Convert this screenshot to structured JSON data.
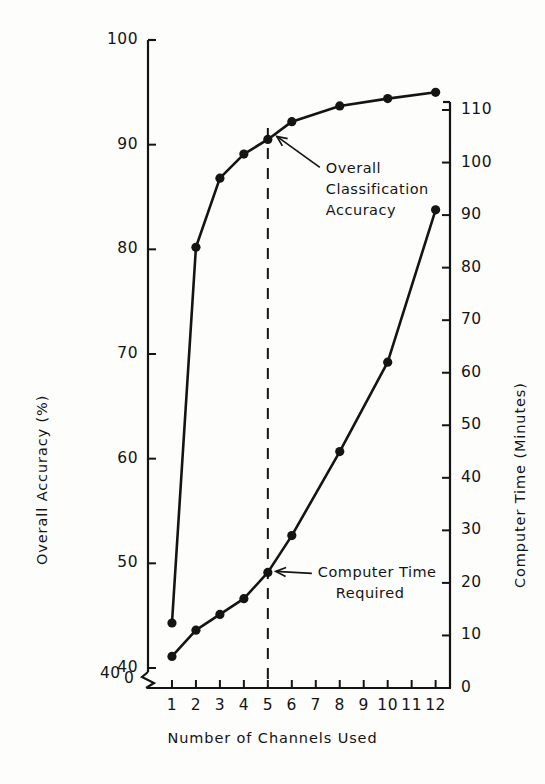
{
  "chart_data": {
    "type": "line",
    "title": "",
    "xlabel": "Number of Channels Used",
    "ylabel": "Overall Accuracy (%)",
    "y2label": "Computer Time (Minutes)",
    "grid": false,
    "legend": "none",
    "xlim": [
      0,
      12.6
    ],
    "ylim": [
      40,
      100
    ],
    "y2lim": [
      0,
      110
    ],
    "x_ticks": [
      1,
      2,
      3,
      4,
      5,
      6,
      7,
      8,
      9,
      10,
      11,
      12
    ],
    "x_tick_labels": [
      "1",
      "2",
      "3",
      "4",
      "5",
      "6",
      "7",
      "8",
      "9",
      "10",
      "11",
      "12"
    ],
    "y_ticks": [
      40,
      50,
      60,
      70,
      80,
      90,
      100
    ],
    "y_tick_labels": [
      "40",
      "50",
      "60",
      "70",
      "80",
      "90",
      "100"
    ],
    "y_axis_break_below": "40",
    "y_origin_label": "0",
    "y2_ticks": [
      0,
      10,
      20,
      30,
      40,
      50,
      60,
      70,
      80,
      90,
      100,
      110
    ],
    "y2_tick_labels": [
      "0",
      "10",
      "20",
      "30",
      "40",
      "50",
      "60",
      "70",
      "80",
      "90",
      "100",
      "110"
    ],
    "reference_line": {
      "x": 5,
      "style": "dashed",
      "label": ""
    },
    "series": [
      {
        "name": "Overall Classification Accuracy",
        "axis": "left",
        "marker": "filled-circle",
        "x": [
          1,
          2,
          3,
          4,
          5,
          6,
          8,
          10,
          12
        ],
        "values": [
          44.3,
          80.2,
          86.8,
          89.1,
          90.5,
          92.2,
          93.7,
          94.4,
          95.0
        ]
      },
      {
        "name": "Computer Time Required",
        "axis": "right",
        "marker": "filled-circle",
        "x": [
          1,
          2,
          3,
          4,
          5,
          6,
          8,
          10,
          12
        ],
        "values": [
          6,
          11,
          14,
          17,
          22,
          29,
          45,
          62,
          91
        ]
      }
    ],
    "annotations": [
      {
        "id": "accuracy-annotation",
        "lines": [
          "Overall",
          "Classification",
          "Accuracy"
        ],
        "arrow_points_to": {
          "x": 5,
          "y": 90.5,
          "axis": "left"
        }
      },
      {
        "id": "time-annotation",
        "lines": [
          "Computer Time",
          "Required"
        ],
        "arrow_points_to": {
          "x": 5,
          "y": 22,
          "axis": "right"
        }
      }
    ]
  },
  "axes": {
    "left_title": "Overall  Accuracy  (%)",
    "right_title": "Computer  Time  (Minutes)",
    "x_title": "Number of  Channels  Used"
  },
  "colors": {
    "ink": "#141414",
    "paper": "#fdfdfb"
  }
}
